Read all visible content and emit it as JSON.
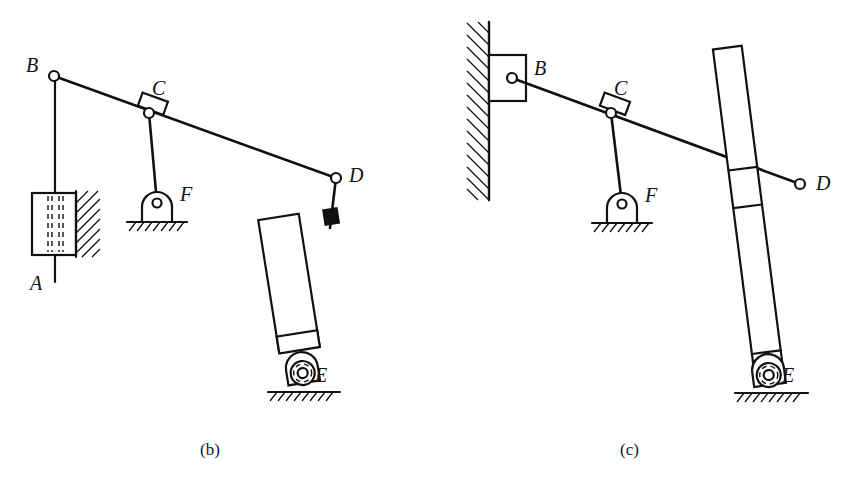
{
  "figure": {
    "background_color": "#ffffff",
    "line_color": "#111111",
    "panels": [
      {
        "id": "panel-b",
        "caption": "(b)",
        "caption_x": 200,
        "caption_y": 455,
        "description": "Mechanism with slider-on-wall at B, rocker at C-F, hydraulic cylinder D-E",
        "labels": [
          {
            "name": "label-B",
            "text": "B",
            "x": 26,
            "y": 72
          },
          {
            "name": "label-C",
            "text": "C",
            "x": 152,
            "y": 95
          },
          {
            "name": "label-D",
            "text": "D",
            "x": 349,
            "y": 182
          },
          {
            "name": "label-F",
            "text": "F",
            "x": 180,
            "y": 201
          },
          {
            "name": "label-E",
            "text": "E",
            "x": 315,
            "y": 382
          },
          {
            "name": "label-A",
            "text": "A",
            "x": 30,
            "y": 290
          }
        ],
        "joints": [
          {
            "name": "joint-B",
            "x": 54,
            "y": 76,
            "r": 5
          },
          {
            "name": "joint-C",
            "x": 149,
            "y": 113,
            "r": 5
          },
          {
            "name": "joint-D",
            "x": 336,
            "y": 178,
            "r": 5
          },
          {
            "name": "joint-F",
            "x": 157,
            "y": 203,
            "r": 4
          },
          {
            "name": "joint-E",
            "x": 303,
            "y": 375,
            "r": 5
          }
        ],
        "members": [
          {
            "name": "link-BD",
            "from": "B",
            "to": "D"
          },
          {
            "name": "link-CF",
            "from": "C",
            "to": "F"
          },
          {
            "name": "rod-BA",
            "from": "B",
            "to": "A"
          },
          {
            "name": "cylinder-DE",
            "from": "D",
            "to": "E"
          }
        ],
        "ground_supports": [
          "F",
          "E"
        ]
      },
      {
        "id": "panel-c",
        "caption": "(c)",
        "caption_x": 620,
        "caption_y": 455,
        "description": "Mechanism with wall-mounted pin at B, rocker at C-F, long bar D-E",
        "labels": [
          {
            "name": "label-B",
            "text": "B",
            "x": 534,
            "y": 75
          },
          {
            "name": "label-C",
            "text": "C",
            "x": 614,
            "y": 95
          },
          {
            "name": "label-D",
            "text": "D",
            "x": 816,
            "y": 190
          },
          {
            "name": "label-F",
            "text": "F",
            "x": 645,
            "y": 202
          },
          {
            "name": "label-E",
            "text": "E",
            "x": 782,
            "y": 382
          }
        ],
        "joints": [
          {
            "name": "joint-B",
            "x": 512,
            "y": 78,
            "r": 5
          },
          {
            "name": "joint-C",
            "x": 611,
            "y": 113,
            "r": 5
          },
          {
            "name": "joint-D",
            "x": 800,
            "y": 184,
            "r": 5
          },
          {
            "name": "joint-F",
            "x": 622,
            "y": 204,
            "r": 4
          },
          {
            "name": "joint-E",
            "x": 769,
            "y": 377,
            "r": 5
          }
        ],
        "members": [
          {
            "name": "link-BD",
            "from": "B",
            "to": "D"
          },
          {
            "name": "link-CF",
            "from": "C",
            "to": "F"
          },
          {
            "name": "bar-DE",
            "from": "D",
            "to": "E"
          }
        ],
        "ground_supports": [
          "F",
          "E"
        ],
        "wall": {
          "name": "fixed-wall",
          "x": 489,
          "y_top": 22,
          "y_bottom": 200
        }
      }
    ]
  }
}
